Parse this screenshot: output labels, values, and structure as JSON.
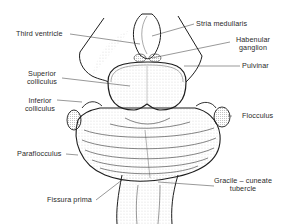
{
  "diagram": {
    "labels": {
      "third_ventricle": "Third ventricle",
      "stria_medullaris": "Stria medullaris",
      "habenular_ganglion_1": "Habenular",
      "habenular_ganglion_2": "ganglion",
      "pulvinar": "Pulvinar",
      "superior_colliculus_1": "Superior",
      "superior_colliculus_2": "colliculus",
      "inferior_colliculus_1": "Inferior",
      "inferior_colliculus_2": "colliculus",
      "flocculus": "Flocculus",
      "paraflocculus": "Paraflocculus",
      "gracile_cuneate_1": "Gracile – cuneate",
      "gracile_cuneate_2": "tubercle",
      "fissura_prima": "Fissura prima"
    },
    "colors": {
      "ink": "#1e1e1e",
      "background": "#ffffff",
      "stipple": "#6b6b6b"
    }
  }
}
